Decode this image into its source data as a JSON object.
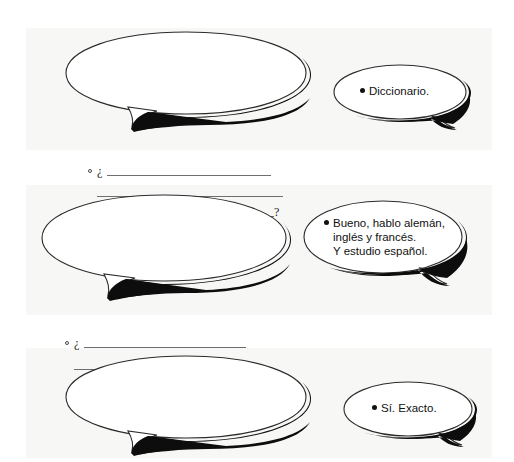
{
  "document": {
    "type": "language-workbook-exercise",
    "language": "Spanish",
    "rows": [
      {
        "id": "exercise-1",
        "prompt_bubble": {
          "bullet": "open-circle",
          "opening_punctuation": "¿",
          "closing_punctuation": "?",
          "blank_lines": 3,
          "value": ""
        },
        "answer_bubble": {
          "bullet": "•",
          "lines": [
            "Diccionario."
          ]
        }
      },
      {
        "id": "exercise-2",
        "prompt_bubble": {
          "bullet": "open-circle",
          "opening_punctuation": "¿",
          "closing_punctuation": "?",
          "blank_lines": 3,
          "value": ""
        },
        "answer_bubble": {
          "bullet": "•",
          "lines": [
            "Bueno, hablo alemán,",
            "inglés y francés.",
            "Y estudio español."
          ]
        }
      },
      {
        "id": "exercise-3",
        "prompt_bubble": {
          "bullet": "open-circle",
          "opening_punctuation": "¿",
          "closing_punctuation": "?",
          "blank_lines": 3,
          "value": ""
        },
        "answer_bubble": {
          "bullet": "•",
          "lines": [
            "Sí. Exacto."
          ]
        }
      }
    ]
  },
  "colors": {
    "ink": "#111111",
    "rule_line": "#6e6e70",
    "bubble_outline": "#2b2b2b",
    "bubble_fill": "#ffffff",
    "shadow": "#0d0d0d",
    "paper": "#f7f7f5",
    "page": "#ffffff"
  }
}
